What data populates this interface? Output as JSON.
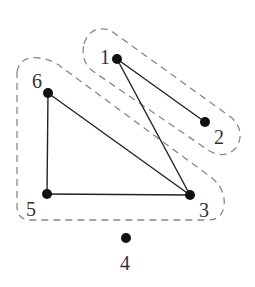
{
  "diagram": {
    "type": "graph",
    "nodes": [
      {
        "id": "1",
        "label": "1",
        "x": 117,
        "y": 59,
        "lx": 100,
        "ly": 64
      },
      {
        "id": "2",
        "label": "2",
        "x": 205,
        "y": 122,
        "lx": 214,
        "ly": 144
      },
      {
        "id": "3",
        "label": "3",
        "x": 190,
        "y": 195,
        "lx": 199,
        "ly": 217
      },
      {
        "id": "4",
        "label": "4",
        "x": 126,
        "y": 238,
        "lx": 120,
        "ly": 270
      },
      {
        "id": "5",
        "label": "5",
        "x": 47,
        "y": 194,
        "lx": 26,
        "ly": 216
      },
      {
        "id": "6",
        "label": "6",
        "x": 48,
        "y": 93,
        "lx": 32,
        "ly": 88
      }
    ],
    "edges": [
      {
        "from": "1",
        "to": "2"
      },
      {
        "from": "1",
        "to": "3"
      },
      {
        "from": "6",
        "to": "3"
      },
      {
        "from": "6",
        "to": "5"
      },
      {
        "from": "5",
        "to": "3"
      }
    ],
    "groups": [
      {
        "name": "group-1-2",
        "members": [
          "1",
          "2"
        ],
        "style": "dashed"
      },
      {
        "name": "group-3-5-6",
        "members": [
          "3",
          "5",
          "6"
        ],
        "style": "dashed"
      }
    ]
  }
}
